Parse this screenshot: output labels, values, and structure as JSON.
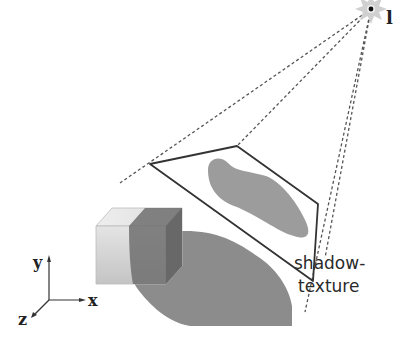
{
  "diagram": {
    "title": "",
    "light": {
      "label": "l",
      "position": [
        371,
        9
      ]
    },
    "texture_label_line1": "shadow-",
    "texture_label_line2": "texture",
    "axes": {
      "x": "x",
      "y": "y",
      "z": "z"
    },
    "colors": {
      "background": "#ffffff",
      "shadow": "#8a8a8a",
      "shadow_texture_blob": "#9c9c9c",
      "cube_light": "#d6d6d6",
      "cube_dark": "#7c7c7c",
      "lines": "#333333",
      "dashed_rays": "#555555",
      "light_glow": "#cccccc"
    }
  }
}
